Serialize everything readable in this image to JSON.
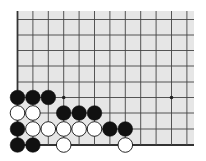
{
  "board": {
    "description": "Go board fragment, lower-left corner",
    "background": "#e6e6e6",
    "line_color": "#444444",
    "edge_color": "#333333",
    "origin_x": 17.5,
    "spacing": 15.4,
    "columns": 12,
    "row_y": [
      19.5,
      35,
      50.5,
      66,
      82,
      97.5,
      113,
      129,
      145
    ],
    "top_y": 11,
    "right_x": 194,
    "bottom_edge_row": 8,
    "left_edge": true,
    "star_points": [
      [
        3,
        5
      ],
      [
        10,
        5
      ]
    ],
    "stones": [
      {
        "color": "black",
        "col": 0,
        "row": 5
      },
      {
        "color": "black",
        "col": 1,
        "row": 5
      },
      {
        "color": "black",
        "col": 2,
        "row": 5
      },
      {
        "color": "white",
        "col": 0,
        "row": 6
      },
      {
        "color": "white",
        "col": 1,
        "row": 6
      },
      {
        "color": "black",
        "col": 3,
        "row": 6
      },
      {
        "color": "black",
        "col": 4,
        "row": 6
      },
      {
        "color": "black",
        "col": 5,
        "row": 6
      },
      {
        "color": "black",
        "col": 0,
        "row": 7
      },
      {
        "color": "white",
        "col": 1,
        "row": 7
      },
      {
        "color": "white",
        "col": 2,
        "row": 7
      },
      {
        "color": "white",
        "col": 3,
        "row": 7
      },
      {
        "color": "white",
        "col": 4,
        "row": 7
      },
      {
        "color": "white",
        "col": 5,
        "row": 7
      },
      {
        "color": "black",
        "col": 6,
        "row": 7
      },
      {
        "color": "black",
        "col": 7,
        "row": 7
      },
      {
        "color": "black",
        "col": 0,
        "row": 8
      },
      {
        "color": "black",
        "col": 1,
        "row": 8
      },
      {
        "color": "white",
        "col": 3,
        "row": 8
      },
      {
        "color": "white",
        "col": 7,
        "row": 8
      }
    ]
  }
}
